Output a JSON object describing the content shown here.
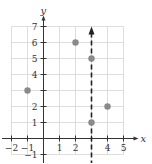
{
  "chart_data": {
    "type": "scatter",
    "title": "",
    "xlabel": "x",
    "ylabel": "y",
    "xlim": [
      -2,
      5
    ],
    "ylim": [
      -1,
      7
    ],
    "grid": true,
    "x_ticks": [
      -2,
      -1,
      1,
      2,
      3,
      4,
      5
    ],
    "x_tick_labels": [
      "−2",
      "−1",
      "1",
      "2",
      "",
      "4",
      "5"
    ],
    "y_ticks": [
      -1,
      1,
      2,
      3,
      4,
      5,
      6,
      7
    ],
    "y_tick_labels": [
      "−1",
      "1",
      "2",
      "",
      "4",
      "5",
      "6",
      "7"
    ],
    "series": [
      {
        "name": "points",
        "points": [
          {
            "x": -1,
            "y": 3
          },
          {
            "x": 2,
            "y": 6
          },
          {
            "x": 3,
            "y": 5
          },
          {
            "x": 3,
            "y": 1
          },
          {
            "x": 4,
            "y": 2
          }
        ],
        "color": "#8a8a8a"
      }
    ],
    "annotations": [
      {
        "type": "vertical-dashed-line",
        "x": 3,
        "arrow": "up",
        "color": "#222222"
      }
    ]
  }
}
